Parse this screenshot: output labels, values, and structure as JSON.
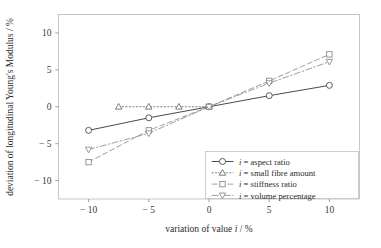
{
  "chart_data": {
    "type": "line",
    "title": "",
    "xlabel": "variation of value i / %",
    "ylabel": "deviation of longitudinal Young's Modulus / %",
    "xlabel_parts": {
      "pre": "variation of value ",
      "italic": "i",
      "post": " / %"
    },
    "ylabel_parts": {
      "pre": "deviation of longitudinal Young's Modulus / %"
    },
    "xlim": [
      -12.5,
      12.5
    ],
    "ylim": [
      -12.5,
      12.5
    ],
    "xticks": [
      -10,
      -5,
      0,
      5,
      10
    ],
    "xticklabels": [
      "− 10",
      "− 5",
      "0",
      "5",
      "10"
    ],
    "yticks": [
      -10,
      -5,
      0,
      5,
      10
    ],
    "yticklabels": [
      "− 10",
      "− 5",
      "0",
      "5",
      "10"
    ],
    "grid": false,
    "legend_position": "lower right",
    "series": [
      {
        "name": "i = aspect ratio",
        "label_pre": "i",
        "label_post": " = aspect ratio",
        "marker": "circle",
        "linestyle": "solid",
        "color": "#4a4a4a",
        "x": [
          -10,
          -5,
          0,
          5,
          10
        ],
        "values": [
          -3.2,
          -1.5,
          0.0,
          1.5,
          2.9
        ]
      },
      {
        "name": "i = small fibre amount",
        "label_pre": "i",
        "label_post": " = small fibre amount",
        "marker": "triangle-up",
        "linestyle": "dotted",
        "color": "#6e6e6e",
        "x": [
          -7.5,
          -5,
          -2.5,
          0
        ],
        "values": [
          0.0,
          0.0,
          0.0,
          0.0
        ]
      },
      {
        "name": "i = stiffness ratio",
        "label_pre": "i",
        "label_post": " = stiffness ratio",
        "marker": "square",
        "linestyle": "dashed",
        "color": "#8c8c8c",
        "x": [
          -10,
          -5,
          0,
          5,
          10
        ],
        "values": [
          -7.5,
          -3.2,
          0.0,
          3.5,
          7.1
        ]
      },
      {
        "name": "i = volume percentage",
        "label_pre": "i",
        "label_post": " = volume percentage",
        "marker": "triangle-down",
        "linestyle": "dashdot",
        "color": "#8c8c8c",
        "x": [
          -10,
          -5,
          0,
          5,
          10
        ],
        "values": [
          -5.8,
          -3.6,
          0.0,
          3.2,
          6.1
        ]
      }
    ]
  },
  "colors": {
    "frame": "#b9b9b9",
    "axis": "#8a8a8a",
    "text": "#2b2b2b",
    "background": "#ffffff"
  }
}
